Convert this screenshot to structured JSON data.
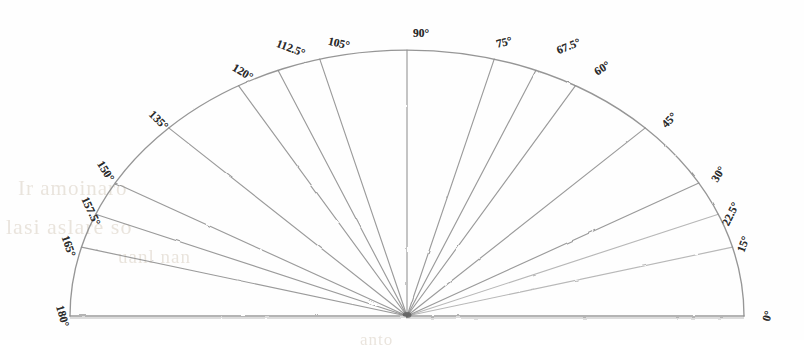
{
  "figure": {
    "kind": "protractor-semicircle",
    "background_color": "#fefefe",
    "line_color": "#8d8d8d",
    "baseline_color": "#a8a8a8",
    "label_color": "#2b2b2b",
    "center": {
      "x": 407,
      "y": 316
    },
    "radius_x": 337,
    "radius_y": 266
  },
  "chart_data": {
    "type": "scatter",
    "title": "",
    "subtitle": "",
    "xlabel": "",
    "ylabel": "",
    "grid": false,
    "legend": "none",
    "note": "Semicircular protractor diagram: radial spokes drawn from a common origin out to a semi-elliptical arc, each spoke labelled with its angle in degrees.",
    "angle_unit": "degrees",
    "axis_range_deg": [
      0,
      180
    ],
    "categories": [
      "0°",
      "15°",
      "22.5°",
      "30°",
      "45°",
      "60°",
      "67.5°",
      "75°",
      "90°",
      "105°",
      "112.5°",
      "120°",
      "135°",
      "150°",
      "157.5°",
      "165°",
      "180°"
    ],
    "values": [
      0,
      15,
      22.5,
      30,
      45,
      60,
      67.5,
      75,
      90,
      105,
      112.5,
      120,
      135,
      150,
      157.5,
      165,
      180
    ]
  },
  "spokes": [
    {
      "label": "0°",
      "deg": 0,
      "lx": 762,
      "ly": 310,
      "rot": -74
    },
    {
      "label": "15°",
      "deg": 15,
      "lx": 735,
      "ly": 238,
      "rot": -70
    },
    {
      "label": "22.5°",
      "deg": 22.5,
      "lx": 718,
      "ly": 208,
      "rot": -64
    },
    {
      "label": "30°",
      "deg": 30,
      "lx": 710,
      "ly": 168,
      "rot": -58
    },
    {
      "label": "45°",
      "deg": 45,
      "lx": 661,
      "ly": 114,
      "rot": -46
    },
    {
      "label": "60°",
      "deg": 60,
      "lx": 594,
      "ly": 62,
      "rot": -32
    },
    {
      "label": "67.5°",
      "deg": 67.5,
      "lx": 556,
      "ly": 40,
      "rot": -22
    },
    {
      "label": "75°",
      "deg": 75,
      "lx": 496,
      "ly": 36,
      "rot": -14
    },
    {
      "label": "90°",
      "deg": 90,
      "lx": 413,
      "ly": 27,
      "rot": 0
    },
    {
      "label": "105°",
      "deg": 105,
      "lx": 328,
      "ly": 37,
      "rot": 13
    },
    {
      "label": "112.5°",
      "deg": 112.5,
      "lx": 276,
      "ly": 42,
      "rot": 21
    },
    {
      "label": "120°",
      "deg": 120,
      "lx": 232,
      "ly": 66,
      "rot": 31
    },
    {
      "label": "135°",
      "deg": 135,
      "lx": 148,
      "ly": 114,
      "rot": 45
    },
    {
      "label": "150°",
      "deg": 150,
      "lx": 95,
      "ly": 165,
      "rot": 58
    },
    {
      "label": "157.5°",
      "deg": 157.5,
      "lx": 76,
      "ly": 205,
      "rot": 65
    },
    {
      "label": "165°",
      "deg": 165,
      "lx": 58,
      "ly": 240,
      "rot": 71
    },
    {
      "label": "180°",
      "deg": 180,
      "lx": 52,
      "ly": 310,
      "rot": 74
    }
  ],
  "ghost_text": {
    "line1": "Ir amoinaro",
    "line2": "lasi aslare so",
    "line3": "uanl nan",
    "line4": "anto"
  }
}
